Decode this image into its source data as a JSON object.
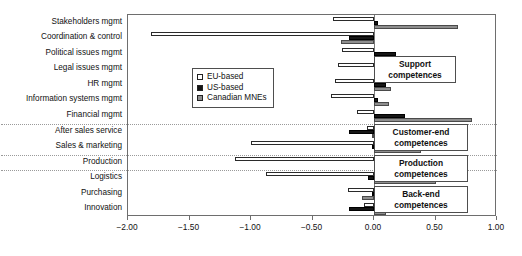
{
  "chart_data": {
    "type": "bar",
    "orientation": "horizontal",
    "title": "",
    "xlabel": "",
    "ylabel": "",
    "xlim": [
      -2.0,
      1.0
    ],
    "grid": false,
    "legend_position": "inside-upper-left",
    "xticks": [
      -2.0,
      -1.5,
      -1.0,
      -0.5,
      0.0,
      0.5,
      1.0
    ],
    "xtick_labels": [
      "−2.00",
      "−1.50",
      "−1.00",
      "−0.50",
      "0.00",
      "0.50",
      "1.00"
    ],
    "categories": [
      "Stakeholders mgmt",
      "Coordination & control",
      "Political issues mgmt",
      "Legal issues mgmt",
      "HR mgmt",
      "Information systems mgmt",
      "Financial mgmt",
      "After sales service",
      "Sales & marketing",
      "Production",
      "Logistics",
      "Purchasing",
      "Innovation"
    ],
    "series": [
      {
        "name": "EU-based",
        "color": "#ffffff",
        "values": [
          -0.33,
          -1.81,
          -0.26,
          -0.29,
          -0.32,
          -0.35,
          -0.14,
          -0.06,
          -1.0,
          -1.13,
          -0.88,
          -0.21,
          -0.08
        ]
      },
      {
        "name": "US-based",
        "color": "#161616",
        "values": [
          0.03,
          -0.2,
          0.18,
          0.43,
          0.1,
          0.03,
          0.25,
          -0.2,
          -0.02,
          0.11,
          -0.05,
          -0.02,
          -0.2
        ]
      },
      {
        "name": "Canadian MNEs",
        "color": "#8e8e8e",
        "values": [
          0.68,
          -0.27,
          0.02,
          0.45,
          0.14,
          0.12,
          0.8,
          -0.02,
          0.38,
          0.11,
          0.5,
          -0.1,
          0.1
        ]
      }
    ],
    "group_separators_after": [
      "Financial mgmt",
      "Sales & marketing",
      "Production"
    ],
    "annotations": [
      {
        "label": "Support\ncompetences",
        "line1": "Support",
        "line2": "competences"
      },
      {
        "label": "Customer-end\ncompetences",
        "line1": "Customer-end",
        "line2": "competences"
      },
      {
        "label": "Production\ncompetences",
        "line1": "Production",
        "line2": "competences"
      },
      {
        "label": "Back-end\ncompetences",
        "line1": "Back-end",
        "line2": "competences"
      }
    ]
  },
  "legend": {
    "items": [
      {
        "label": "EU-based"
      },
      {
        "label": "US-based"
      },
      {
        "label": "Canadian MNEs"
      }
    ]
  },
  "annotations": {
    "support": {
      "line1": "Support",
      "line2": "competences"
    },
    "customer_end": {
      "line1": "Customer-end",
      "line2": "competences"
    },
    "production": {
      "line1": "Production",
      "line2": "competences"
    },
    "back_end": {
      "line1": "Back-end",
      "line2": "competences"
    }
  }
}
